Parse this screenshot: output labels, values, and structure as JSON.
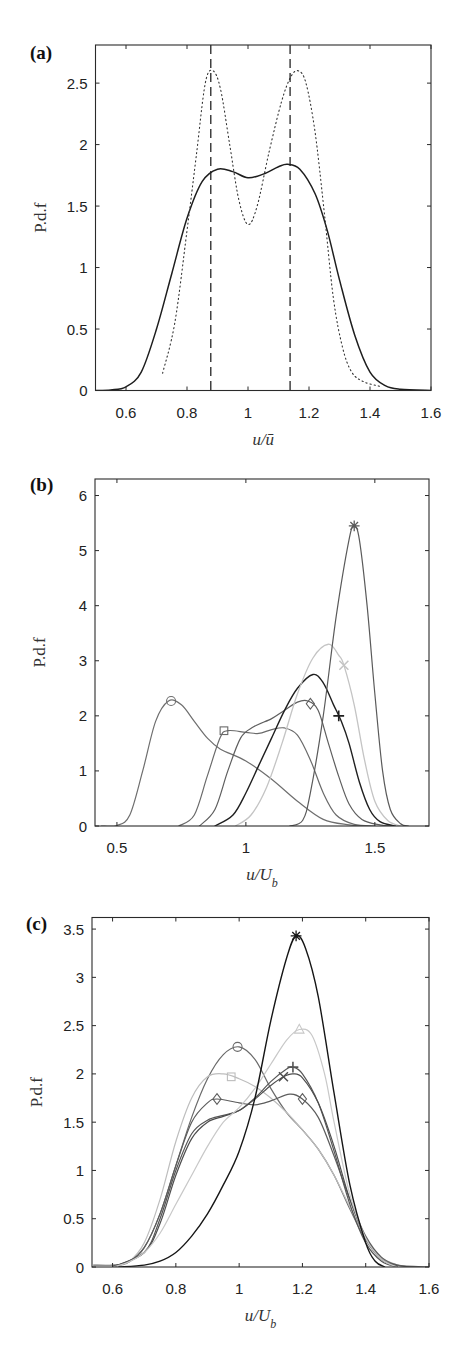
{
  "figure": {
    "panels": [
      {
        "label": "(a)",
        "xlabel": "u/ū",
        "ylabel": "P.d.f"
      },
      {
        "label": "(b)",
        "xlabel": "u/U_b",
        "ylabel": "P.d.f"
      },
      {
        "label": "(c)",
        "xlabel": "u/U_b",
        "ylabel": "P.d.f"
      }
    ]
  },
  "chart_data": [
    {
      "type": "line",
      "title": "(a)",
      "xlabel": "u/ū",
      "ylabel": "P.d.f",
      "xlim": [
        0.5,
        1.6
      ],
      "ylim": [
        0,
        2.81
      ],
      "xticks": [
        0.6,
        0.8,
        1,
        1.2,
        1.4,
        1.6
      ],
      "xtick_labels": [
        "0.6",
        "0.8",
        "1",
        "1.2",
        "1.4",
        "1.6"
      ],
      "yticks": [
        0,
        0.5,
        1,
        1.5,
        2,
        2.5
      ],
      "ytick_labels": [
        "0",
        "0.5",
        "1",
        "1.5",
        "2",
        "2.5"
      ],
      "grid": false,
      "box": {
        "x0": 95.5,
        "x1": 431,
        "y0": 45,
        "y1": 390.5
      },
      "series": [
        {
          "name": "solid",
          "style": "solid",
          "color": "#1e1e1e",
          "width": 1.5,
          "x": [
            0.5,
            0.55,
            0.6,
            0.65,
            0.7,
            0.75,
            0.8,
            0.85,
            0.9,
            0.95,
            1.0,
            1.05,
            1.1,
            1.13,
            1.17,
            1.22,
            1.26,
            1.3,
            1.35,
            1.4,
            1.45,
            1.5,
            1.6
          ],
          "y": [
            0,
            0.005,
            0.03,
            0.15,
            0.5,
            0.95,
            1.4,
            1.7,
            1.8,
            1.78,
            1.73,
            1.76,
            1.82,
            1.84,
            1.8,
            1.6,
            1.3,
            0.9,
            0.45,
            0.15,
            0.04,
            0.01,
            0
          ]
        },
        {
          "name": "dotted",
          "style": "dotted",
          "color": "#333333",
          "width": 1.1,
          "x": [
            0.72,
            0.76,
            0.8,
            0.83,
            0.86,
            0.885,
            0.91,
            0.94,
            0.97,
            1.0,
            1.03,
            1.07,
            1.11,
            1.14,
            1.165,
            1.19,
            1.22,
            1.25,
            1.28,
            1.31,
            1.34,
            1.38,
            1.44
          ],
          "y": [
            0.14,
            0.55,
            1.3,
            1.9,
            2.5,
            2.6,
            2.45,
            2.0,
            1.55,
            1.35,
            1.5,
            1.95,
            2.35,
            2.55,
            2.6,
            2.5,
            2.1,
            1.45,
            0.75,
            0.35,
            0.15,
            0.07,
            0.03
          ]
        }
      ],
      "vlines": [
        {
          "x": 0.878,
          "style": "dashed",
          "color": "#222222"
        },
        {
          "x": 1.138,
          "style": "dashed",
          "color": "#222222"
        }
      ]
    },
    {
      "type": "line",
      "title": "(b)",
      "xlabel": "u/U_b",
      "ylabel": "P.d.f",
      "xlim": [
        0.415,
        1.71
      ],
      "ylim": [
        0,
        6.3
      ],
      "xticks": [
        0.5,
        1,
        1.5
      ],
      "xtick_labels": [
        "0.5",
        "1",
        "1.5"
      ],
      "yticks": [
        0,
        1,
        2,
        3,
        4,
        5,
        6
      ],
      "ytick_labels": [
        "0",
        "1",
        "2",
        "3",
        "4",
        "5",
        "6"
      ],
      "grid": false,
      "box": {
        "x0": 95,
        "x1": 429,
        "y0": 479,
        "y1": 826
      },
      "series": [
        {
          "name": "circle",
          "marker": "o",
          "marker_at": [
            0.71,
            2.27
          ],
          "color": "#6e6e6e",
          "width": 1.2,
          "x": [
            0.44,
            0.5,
            0.55,
            0.6,
            0.65,
            0.7,
            0.75,
            0.8,
            0.85,
            0.9,
            1.0,
            1.1,
            1.2,
            1.3,
            1.4,
            1.46
          ],
          "y": [
            0,
            0.01,
            0.2,
            1.0,
            1.9,
            2.27,
            2.2,
            1.9,
            1.6,
            1.4,
            1.18,
            0.85,
            0.45,
            0.12,
            0.02,
            0
          ]
        },
        {
          "name": "square",
          "marker": "s",
          "marker_at": [
            0.915,
            1.73
          ],
          "color": "#6a6a6a",
          "width": 1.2,
          "x": [
            0.74,
            0.8,
            0.85,
            0.9,
            0.93,
            1.0,
            1.05,
            1.1,
            1.15,
            1.2,
            1.25,
            1.3,
            1.35,
            1.42,
            1.5
          ],
          "y": [
            0,
            0.2,
            0.9,
            1.6,
            1.73,
            1.7,
            1.68,
            1.75,
            1.78,
            1.65,
            1.2,
            0.6,
            0.2,
            0.03,
            0
          ]
        },
        {
          "name": "diamond",
          "marker": "d",
          "marker_at": [
            1.25,
            2.22
          ],
          "color": "#5e5e5e",
          "width": 1.2,
          "x": [
            0.82,
            0.88,
            0.93,
            0.98,
            1.03,
            1.1,
            1.15,
            1.2,
            1.24,
            1.28,
            1.32,
            1.36,
            1.4,
            1.45,
            1.52,
            1.57
          ],
          "y": [
            0,
            0.3,
            1.0,
            1.6,
            1.8,
            1.95,
            2.1,
            2.25,
            2.27,
            2.1,
            1.5,
            0.9,
            0.4,
            0.12,
            0.02,
            0
          ]
        },
        {
          "name": "plus",
          "marker": "+",
          "marker_at": [
            1.36,
            2.0
          ],
          "color": "#1f1f1f",
          "width": 1.4,
          "x": [
            0.88,
            0.95,
            1.0,
            1.05,
            1.1,
            1.15,
            1.2,
            1.26,
            1.3,
            1.34,
            1.37,
            1.4,
            1.44,
            1.48,
            1.52,
            1.58
          ],
          "y": [
            0,
            0.2,
            0.6,
            1.1,
            1.6,
            2.1,
            2.5,
            2.75,
            2.6,
            2.2,
            1.9,
            1.5,
            0.8,
            0.3,
            0.08,
            0
          ]
        },
        {
          "name": "x",
          "marker": "x",
          "marker_at": [
            1.38,
            2.92
          ],
          "color": "#c4c4c4",
          "width": 1.3,
          "x": [
            0.96,
            1.02,
            1.08,
            1.14,
            1.2,
            1.26,
            1.32,
            1.36,
            1.38,
            1.42,
            1.46,
            1.5,
            1.55,
            1.6
          ],
          "y": [
            0,
            0.2,
            0.7,
            1.5,
            2.4,
            3.05,
            3.3,
            3.1,
            2.92,
            2.2,
            1.2,
            0.45,
            0.1,
            0
          ]
        },
        {
          "name": "asterisk",
          "marker": "*",
          "marker_at": [
            1.42,
            5.45
          ],
          "color": "#5a5a5a",
          "width": 1.2,
          "x": [
            1.17,
            1.22,
            1.25,
            1.3,
            1.35,
            1.4,
            1.42,
            1.44,
            1.47,
            1.5,
            1.53,
            1.56,
            1.6,
            1.63
          ],
          "y": [
            0,
            0.1,
            0.6,
            2.0,
            3.8,
            5.2,
            5.45,
            5.2,
            4.0,
            2.4,
            1.0,
            0.3,
            0.04,
            0
          ]
        }
      ]
    },
    {
      "type": "line",
      "title": "(c)",
      "xlabel": "u/U_b",
      "ylabel": "P.d.f",
      "xlim": [
        0.535,
        1.6
      ],
      "ylim": [
        0,
        3.62
      ],
      "xticks": [
        0.6,
        0.8,
        1,
        1.2,
        1.4,
        1.6
      ],
      "xtick_labels": [
        "0.6",
        "0.8",
        "1",
        "1.2",
        "1.4",
        "1.6"
      ],
      "yticks": [
        0,
        0.5,
        1,
        1.5,
        2,
        2.5,
        3,
        3.5
      ],
      "ytick_labels": [
        "0",
        "0.5",
        "1",
        "1.5",
        "2",
        "2.5",
        "3",
        "3.5"
      ],
      "grid": false,
      "box": {
        "x0": 92,
        "x1": 429,
        "y0": 917.5,
        "y1": 1267
      },
      "series": [
        {
          "name": "circle",
          "marker": "o",
          "marker_at": [
            0.995,
            2.28
          ],
          "color": "#6a6a6a",
          "width": 1.2,
          "x": [
            0.54,
            0.6,
            0.65,
            0.7,
            0.75,
            0.8,
            0.85,
            0.9,
            0.95,
            1.0,
            1.05,
            1.1,
            1.15,
            1.2,
            1.25,
            1.3,
            1.35,
            1.4,
            1.45,
            1.5,
            1.6
          ],
          "y": [
            0.02,
            0.02,
            0.05,
            0.2,
            0.55,
            1.05,
            1.55,
            1.95,
            2.2,
            2.28,
            2.15,
            1.85,
            1.6,
            1.42,
            1.22,
            0.95,
            0.6,
            0.28,
            0.08,
            0.02,
            0
          ]
        },
        {
          "name": "square",
          "marker": "s",
          "marker_at": [
            0.975,
            1.97
          ],
          "color": "#bdbdbd",
          "width": 1.2,
          "x": [
            0.6,
            0.65,
            0.7,
            0.75,
            0.8,
            0.85,
            0.9,
            0.95,
            1.0,
            1.05,
            1.1,
            1.15,
            1.2,
            1.25,
            1.3,
            1.35,
            1.4,
            1.45,
            1.5
          ],
          "y": [
            0,
            0.05,
            0.25,
            0.7,
            1.3,
            1.75,
            1.97,
            2.0,
            1.95,
            1.87,
            1.75,
            1.6,
            1.42,
            1.22,
            0.95,
            0.62,
            0.3,
            0.1,
            0.02
          ]
        },
        {
          "name": "diamond",
          "marker": "d",
          "marker_at": [
            [
              0.93,
              1.74
            ],
            [
              1.2,
              1.74
            ]
          ],
          "color": "#5c5c5c",
          "width": 1.2,
          "x": [
            0.6,
            0.65,
            0.7,
            0.75,
            0.8,
            0.85,
            0.9,
            0.93,
            1.0,
            1.05,
            1.1,
            1.16,
            1.2,
            1.25,
            1.3,
            1.35,
            1.4,
            1.45,
            1.5,
            1.55
          ],
          "y": [
            0.01,
            0.05,
            0.2,
            0.55,
            1.05,
            1.5,
            1.7,
            1.74,
            1.7,
            1.68,
            1.72,
            1.79,
            1.74,
            1.55,
            1.15,
            0.7,
            0.32,
            0.1,
            0.02,
            0
          ]
        },
        {
          "name": "plus",
          "marker": "+",
          "marker_at": [
            1.17,
            2.07
          ],
          "color": "#555555",
          "width": 1.2,
          "x": [
            0.6,
            0.7,
            0.75,
            0.8,
            0.85,
            0.9,
            0.95,
            1.0,
            1.05,
            1.1,
            1.15,
            1.17,
            1.2,
            1.25,
            1.3,
            1.35,
            1.4,
            1.45,
            1.5
          ],
          "y": [
            0,
            0.15,
            0.5,
            1.0,
            1.38,
            1.52,
            1.57,
            1.62,
            1.75,
            1.92,
            2.05,
            2.07,
            2.0,
            1.7,
            1.2,
            0.65,
            0.25,
            0.06,
            0
          ]
        },
        {
          "name": "x",
          "marker": "x",
          "marker_at": [
            1.14,
            1.97
          ],
          "color": "#4e4e4e",
          "width": 1.2,
          "x": [
            0.6,
            0.7,
            0.75,
            0.8,
            0.85,
            0.9,
            0.95,
            1.0,
            1.05,
            1.1,
            1.14,
            1.17,
            1.2,
            1.25,
            1.3,
            1.35,
            1.4,
            1.45,
            1.5
          ],
          "y": [
            0,
            0.15,
            0.45,
            0.95,
            1.33,
            1.5,
            1.56,
            1.62,
            1.74,
            1.88,
            1.97,
            2.0,
            1.96,
            1.7,
            1.25,
            0.7,
            0.3,
            0.08,
            0.01
          ]
        },
        {
          "name": "triangle",
          "marker": "^",
          "marker_at": [
            1.19,
            2.46
          ],
          "color": "#c8c8c8",
          "width": 1.2,
          "x": [
            0.6,
            0.65,
            0.7,
            0.75,
            0.8,
            0.85,
            0.9,
            0.95,
            1.0,
            1.05,
            1.1,
            1.15,
            1.19,
            1.23,
            1.27,
            1.3,
            1.35,
            1.4,
            1.45,
            1.5
          ],
          "y": [
            0,
            0.05,
            0.15,
            0.35,
            0.65,
            0.95,
            1.25,
            1.5,
            1.65,
            1.85,
            2.1,
            2.35,
            2.46,
            2.4,
            2.0,
            1.5,
            0.75,
            0.3,
            0.08,
            0
          ]
        },
        {
          "name": "asterisk",
          "marker": "*",
          "marker_at": [
            1.18,
            3.43
          ],
          "color": "#161616",
          "width": 1.4,
          "x": [
            0.62,
            0.7,
            0.75,
            0.8,
            0.85,
            0.9,
            0.95,
            1.0,
            1.05,
            1.1,
            1.15,
            1.18,
            1.21,
            1.25,
            1.3,
            1.35,
            1.4,
            1.43,
            1.46
          ],
          "y": [
            0,
            0.02,
            0.06,
            0.15,
            0.32,
            0.55,
            0.85,
            1.2,
            1.75,
            2.55,
            3.2,
            3.43,
            3.3,
            2.8,
            1.8,
            0.85,
            0.25,
            0.06,
            0
          ]
        }
      ]
    }
  ]
}
